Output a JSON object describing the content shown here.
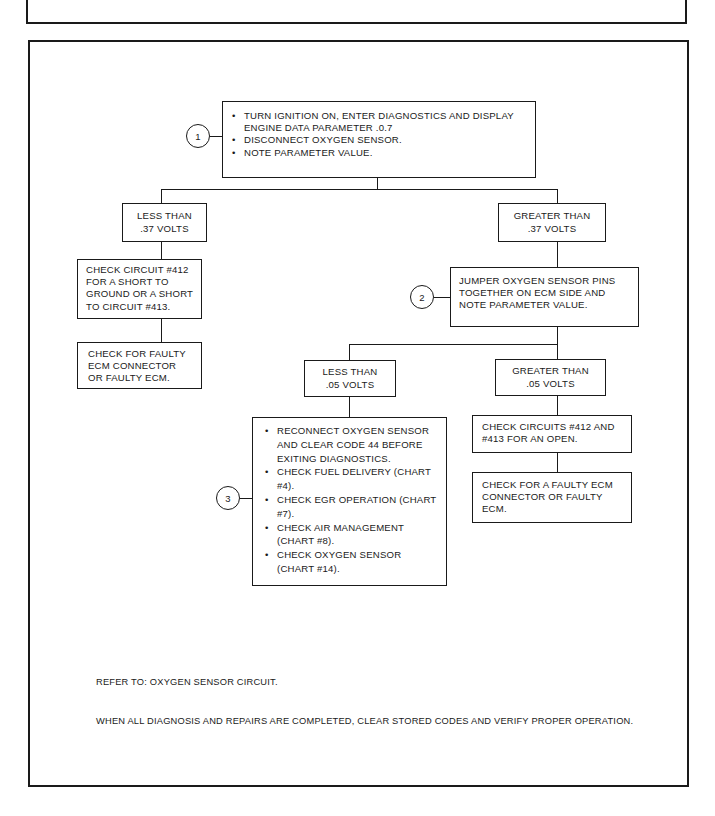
{
  "header": {
    "title": "LEAN EXHAUST SIGNAL"
  },
  "flowchart": {
    "step1": {
      "number": "1",
      "items": [
        "TURN IGNITION ON, ENTER DIAGNOSTICS AND DISPLAY ENGINE DATA PARAMETER .0.7",
        "DISCONNECT OXYGEN SENSOR.",
        "NOTE PARAMETER VALUE."
      ]
    },
    "branch_low_37": {
      "line1": "LESS THAN",
      "line2": ".37 VOLTS"
    },
    "branch_high_37": {
      "line1": "GREATER THAN",
      "line2": ".37 VOLTS"
    },
    "check_circuit_412": "CHECK CIRCUIT #412 FOR A SHORT TO GROUND OR A SHORT TO CIRCUIT #413.",
    "check_faulty_ecm_left": "CHECK FOR FAULTY ECM CONNECTOR OR FAULTY ECM.",
    "step2": {
      "number": "2",
      "text": "JUMPER OXYGEN SENSOR PINS TOGETHER ON ECM SIDE AND NOTE PARAMETER VALUE."
    },
    "branch_low_05": {
      "line1": "LESS THAN",
      "line2": ".05 VOLTS"
    },
    "branch_high_05": {
      "line1": "GREATER THAN",
      "line2": ".05 VOLTS"
    },
    "step3": {
      "number": "3",
      "items": [
        "RECONNECT OXYGEN SENSOR AND CLEAR CODE 44 BEFORE EXITING DIAGNOSTICS.",
        "CHECK FUEL DELIVERY (CHART #4).",
        "CHECK EGR OPERATION (CHART #7).",
        "CHECK AIR MANAGEMENT (CHART #8).",
        "CHECK OXYGEN SENSOR (CHART #14)."
      ]
    },
    "check_circuits_open": "CHECK CIRCUITS #412 AND #413 FOR AN OPEN.",
    "check_faulty_ecm_right": "CHECK FOR A FAULTY ECM CONNECTOR OR FAULTY ECM."
  },
  "notes": {
    "refer_to": "REFER TO: OXYGEN SENSOR CIRCUIT.",
    "completion": "WHEN ALL DIAGNOSIS AND REPAIRS ARE COMPLETED, CLEAR STORED CODES AND VERIFY PROPER OPERATION."
  }
}
